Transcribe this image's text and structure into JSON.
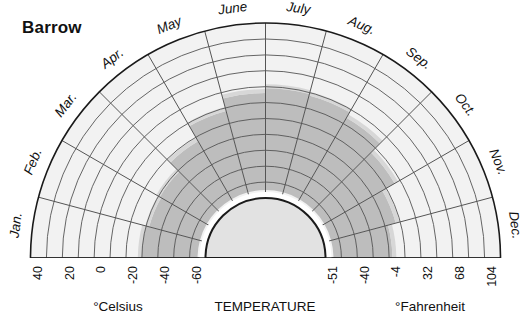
{
  "chart_data": {
    "type": "area",
    "title": "Barrow",
    "subtitle": "",
    "plot_kind": "semicircular-polar-climogram",
    "xlabel": "TEMPERATURE",
    "ylabel": "",
    "angular_axis": {
      "name": "Month",
      "categories": [
        "Jan.",
        "Feb.",
        "Mar.",
        "Apr.",
        "May",
        "June",
        "July",
        "Aug.",
        "Sep.",
        "Oct.",
        "Nov.",
        "Dec."
      ],
      "direction": "left-to-right across the semicircle, Jan. at left horizon, July at top, Dec. at right horizon",
      "sector_degrees": 15
    },
    "radial_axis": {
      "name": "Temperature",
      "celsius_ticks": [
        "40",
        "20",
        "0",
        "-20",
        "-40",
        "-60"
      ],
      "celsius_values": [
        40,
        20,
        0,
        -20,
        -40,
        -60
      ],
      "fahrenheit_ticks": [
        "-51",
        "-40",
        "-4",
        "32",
        "68",
        "104"
      ],
      "fahrenheit_values": [
        -51,
        -40,
        -4,
        32,
        68,
        104
      ],
      "celsius_caption": "°Celsius",
      "fahrenheit_caption": "°Fahrenheit",
      "ring_step_celsius": 10,
      "label_step_celsius": 20,
      "outer_value_celsius": 45,
      "inner_value_celsius": -65,
      "direction": "largest at outer rim, decreasing inward"
    },
    "series": [
      {
        "name": "Mean monthly temperature band",
        "categories": [
          "Jan.",
          "Feb.",
          "Mar.",
          "Apr.",
          "May",
          "June",
          "July",
          "Aug.",
          "Sep.",
          "Oct.",
          "Nov.",
          "Dec."
        ],
        "outer_celsius": [
          -25,
          -27,
          -26,
          -18,
          -7,
          1,
          4,
          3,
          -1,
          -9,
          -18,
          -23
        ],
        "inner_celsius": [
          -60,
          -60,
          -60,
          -60,
          -60,
          -60,
          -60,
          -60,
          -60,
          -60,
          -60,
          -60
        ]
      }
    ],
    "bands": {
      "outer_band_label": "outside band (above temperature)",
      "shaded_band_label": "temperature range band"
    },
    "grid": true,
    "legend": "none",
    "colors": {
      "page_background": "#ffffff",
      "outer_ring_fill": "#f2f2f2",
      "shaded_band_fill": "#bdbdbd",
      "core_fill": "#e2e2e2",
      "gridline": "#555555",
      "outline": "#1a1a1a",
      "text": "#111111"
    }
  },
  "chart": {
    "title": "Barrow",
    "months": [
      "Jan.",
      "Feb.",
      "Mar.",
      "Apr.",
      "May",
      "June",
      "July",
      "Aug.",
      "Sep.",
      "Oct.",
      "Nov.",
      "Dec."
    ],
    "celsius_ticks": [
      "40",
      "20",
      "0",
      "-20",
      "-40",
      "-60"
    ],
    "fahrenheit_ticks": [
      "-51",
      "-40",
      "-4",
      "32",
      "68",
      "104"
    ],
    "celsius_caption": "°Celsius",
    "fahrenheit_caption": "°Fahrenheit",
    "center_caption": "TEMPERATURE"
  }
}
